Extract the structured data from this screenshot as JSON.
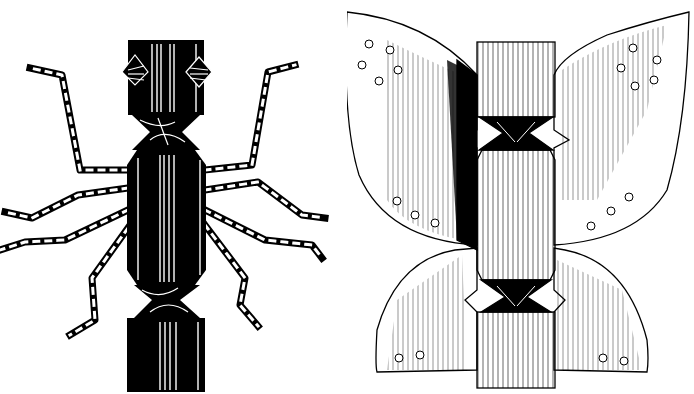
{
  "illustration": {
    "style": "black and white ink drawing",
    "background": "#ffffff",
    "ink": "#000000",
    "figures": [
      {
        "id": "spider",
        "description": "Christmas cracker decorated as a spider with black wrapping, two eyes and eight striped legs"
      },
      {
        "id": "butterfly",
        "description": "Christmas cracker decorated as a butterfly with four hatched wings dotted with small circles"
      }
    ]
  }
}
